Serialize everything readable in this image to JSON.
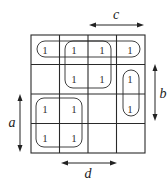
{
  "diagram": {
    "type": "karnaugh-map",
    "rows": 4,
    "cols": 4,
    "cells": [
      [
        "1",
        "1",
        "1",
        "1"
      ],
      [
        "",
        "1",
        "1",
        "1"
      ],
      [
        "1",
        "1",
        "",
        "1"
      ],
      [
        "1",
        "1",
        "",
        ""
      ]
    ],
    "variables": {
      "a": "a",
      "b": "b",
      "c": "c",
      "d": "d"
    },
    "groupings": [
      {
        "name": "row0-wrap",
        "cells": [
          [
            0,
            0
          ],
          [
            0,
            3
          ]
        ]
      },
      {
        "name": "center-quad",
        "cells": [
          [
            0,
            1
          ],
          [
            0,
            2
          ],
          [
            1,
            1
          ],
          [
            1,
            2
          ]
        ]
      },
      {
        "name": "col3-pair",
        "cells": [
          [
            1,
            3
          ],
          [
            2,
            3
          ]
        ]
      },
      {
        "name": "bottom-left-quad",
        "cells": [
          [
            2,
            0
          ],
          [
            2,
            1
          ],
          [
            3,
            0
          ],
          [
            3,
            1
          ]
        ]
      }
    ]
  }
}
